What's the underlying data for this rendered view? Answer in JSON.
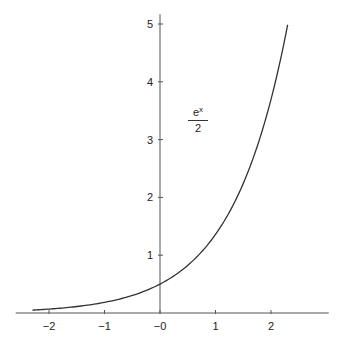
{
  "chart_data": {
    "type": "line",
    "title": "",
    "xlabel": "",
    "ylabel": "",
    "annotation": {
      "numerator_base": "e",
      "numerator_exp": "x",
      "denominator": "2",
      "text": "e^x / 2"
    },
    "x_ticks": [
      -2,
      -1,
      0,
      1,
      2
    ],
    "x_tick_labels": [
      "−2",
      "−1",
      "−0",
      "1",
      "2"
    ],
    "y_ticks": [
      1,
      2,
      3,
      4,
      5
    ],
    "y_tick_labels": [
      "1",
      "2",
      "3",
      "4",
      "5"
    ],
    "xlim": [
      -2.6,
      3.04
    ],
    "ylim": [
      0,
      5.1
    ],
    "grid": false,
    "legend": null,
    "series": [
      {
        "name": "e^x/2",
        "function": "exp(x)/2",
        "x": [
          -2.3,
          -2.0,
          -1.5,
          -1.0,
          -0.5,
          0.0,
          0.5,
          1.0,
          1.5,
          2.0,
          2.3
        ],
        "values": [
          0.05,
          0.068,
          0.112,
          0.184,
          0.303,
          0.5,
          0.824,
          1.359,
          2.241,
          3.695,
          4.987
        ]
      }
    ]
  },
  "colors": {
    "axis": "#555555",
    "curve": "#333333",
    "background": "#ffffff"
  }
}
